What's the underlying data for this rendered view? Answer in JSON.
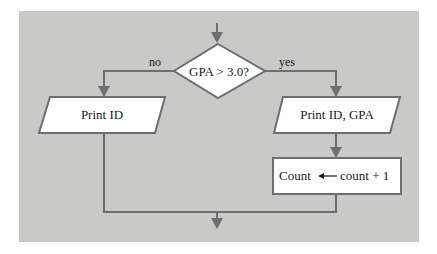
{
  "diagram": {
    "type": "flowchart",
    "colors": {
      "background": "#c9c9c7",
      "line": "#6e6e6e",
      "shape_fill": "#ffffff",
      "text": "#1a1a1a"
    },
    "nodes": [
      {
        "id": "decision",
        "shape": "diamond",
        "label": "GPA > 3.0?"
      },
      {
        "id": "print-id",
        "shape": "parallelogram",
        "label": "Print ID"
      },
      {
        "id": "print-id-gpa",
        "shape": "parallelogram",
        "label": "Print ID, GPA"
      },
      {
        "id": "increment",
        "shape": "rectangle",
        "label_left": "Count",
        "arrow": "←",
        "label_right": "count + 1"
      }
    ],
    "edges": [
      {
        "from": "entry",
        "to": "decision"
      },
      {
        "from": "decision",
        "to": "print-id",
        "label": "no"
      },
      {
        "from": "decision",
        "to": "print-id-gpa",
        "label": "yes"
      },
      {
        "from": "print-id-gpa",
        "to": "increment"
      },
      {
        "from": "print-id",
        "to": "exit"
      },
      {
        "from": "increment",
        "to": "exit"
      }
    ],
    "branch_labels": {
      "no": "no",
      "yes": "yes"
    }
  }
}
